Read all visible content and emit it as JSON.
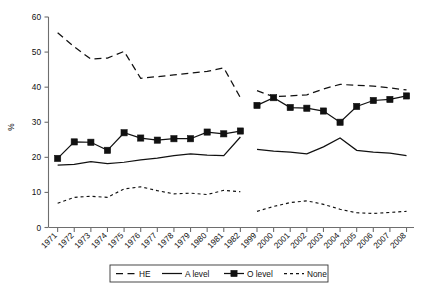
{
  "chart_data": {
    "type": "line",
    "title": "",
    "xlabel": "",
    "ylabel": "%",
    "ylim": [
      0,
      60
    ],
    "yticks": [
      0,
      10,
      20,
      30,
      40,
      50,
      60
    ],
    "grid": false,
    "legend_position": "bottom",
    "categories": [
      "1971",
      "1972",
      "1973",
      "1974",
      "1975",
      "1976",
      "1977",
      "1978",
      "1979",
      "1980",
      "1981",
      "1982",
      "1999",
      "2000",
      "2001",
      "2002",
      "2003",
      "2004",
      "2005",
      "2006",
      "2007",
      "2008"
    ],
    "series": [
      {
        "name": "HE",
        "style": "dashed",
        "marker": "none",
        "color": "#111111",
        "values": [
          55.5,
          51.5,
          48.0,
          48.3,
          50.2,
          42.5,
          43.0,
          43.5,
          44.0,
          44.5,
          45.5,
          37.0,
          null,
          null,
          null,
          null,
          null,
          null,
          null,
          null,
          null,
          null
        ]
      },
      {
        "name": "HE",
        "style": "dashed",
        "marker": "none",
        "color": "#111111",
        "segment": 2,
        "values": [
          null,
          null,
          null,
          null,
          null,
          null,
          null,
          null,
          null,
          null,
          null,
          null,
          39.0,
          37.3,
          37.5,
          37.8,
          39.5,
          40.8,
          40.5,
          40.3,
          39.8,
          39.2
        ]
      },
      {
        "name": "A level",
        "style": "solid",
        "marker": "none",
        "color": "#111111",
        "values": [
          17.8,
          18.0,
          18.8,
          18.2,
          18.6,
          19.3,
          19.8,
          20.5,
          21.0,
          20.6,
          20.5,
          25.8,
          null,
          null,
          null,
          null,
          null,
          null,
          null,
          null,
          null,
          null
        ]
      },
      {
        "name": "A level",
        "style": "solid",
        "marker": "none",
        "color": "#111111",
        "segment": 2,
        "values": [
          null,
          null,
          null,
          null,
          null,
          null,
          null,
          null,
          null,
          null,
          null,
          null,
          22.3,
          21.8,
          21.5,
          21.0,
          23.0,
          25.5,
          22.0,
          21.5,
          21.2,
          20.5
        ]
      },
      {
        "name": "O level",
        "style": "solid",
        "marker": "square",
        "color": "#111111",
        "values": [
          19.7,
          24.4,
          24.3,
          22.0,
          27.0,
          25.5,
          24.9,
          25.3,
          25.3,
          27.2,
          26.7,
          27.5,
          null,
          null,
          null,
          null,
          null,
          null,
          null,
          null,
          null,
          null
        ]
      },
      {
        "name": "O level",
        "style": "solid",
        "marker": "square",
        "color": "#111111",
        "segment": 2,
        "values": [
          null,
          null,
          null,
          null,
          null,
          null,
          null,
          null,
          null,
          null,
          null,
          null,
          34.8,
          37.0,
          34.2,
          34.0,
          33.2,
          30.0,
          34.5,
          36.2,
          36.5,
          37.5
        ]
      },
      {
        "name": "None",
        "style": "dotted",
        "marker": "none",
        "color": "#111111",
        "values": [
          6.9,
          8.6,
          8.9,
          8.6,
          11.0,
          11.6,
          10.5,
          9.6,
          9.8,
          9.4,
          10.6,
          10.2,
          null,
          null,
          null,
          null,
          null,
          null,
          null,
          null,
          null,
          null
        ]
      },
      {
        "name": "None",
        "style": "dotted",
        "marker": "none",
        "color": "#111111",
        "segment": 2,
        "values": [
          null,
          null,
          null,
          null,
          null,
          null,
          null,
          null,
          null,
          null,
          null,
          null,
          4.6,
          6.0,
          7.1,
          7.6,
          6.6,
          5.2,
          4.2,
          4.0,
          4.3,
          4.6
        ]
      }
    ],
    "legend": [
      {
        "label": "HE",
        "style": "dashed",
        "marker": "none"
      },
      {
        "label": "A level",
        "style": "solid",
        "marker": "none"
      },
      {
        "label": "O level",
        "style": "solid",
        "marker": "square"
      },
      {
        "label": "None",
        "style": "dotted",
        "marker": "none"
      }
    ]
  }
}
